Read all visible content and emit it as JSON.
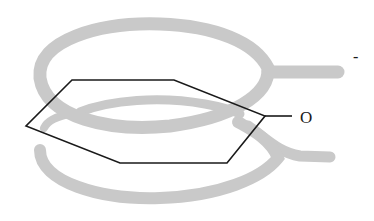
{
  "diagram": {
    "type": "molecular-orbital-illustration",
    "molecule": "phenoxide ion",
    "atoms": [
      {
        "label": "O",
        "role": "oxygen-substituent"
      }
    ],
    "charge": {
      "label": "-"
    },
    "colors": {
      "bond": "#1a1a1a",
      "orbital_lobe": "#c9c9c9",
      "background": "#ffffff"
    },
    "elements": {
      "ring": "hexagon (benzene ring, drawn in perspective)",
      "upper_lobe": "delocalized pi-electron cloud above ring, extending over oxygen",
      "lower_lobe": "delocalized pi-electron cloud below ring, extending under oxygen"
    }
  }
}
